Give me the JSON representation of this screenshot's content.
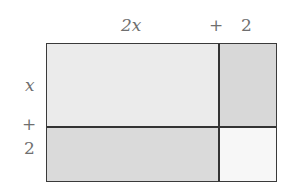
{
  "diagram": {
    "top_labels": {
      "first": "2x",
      "plus": "+",
      "second": "2"
    },
    "side_labels": {
      "first": "x",
      "plus": "+",
      "second": "2"
    },
    "regions": [
      {
        "id": "2x-by-x",
        "row": "x",
        "col": "2x",
        "color": "#ebebeb"
      },
      {
        "id": "2-by-x",
        "row": "x",
        "col": "2",
        "color": "#d8d8d8"
      },
      {
        "id": "2x-by-2",
        "row": "2",
        "col": "2x",
        "color": "#dadada"
      },
      {
        "id": "2-by-2",
        "row": "2",
        "col": "2",
        "color": "#f7f7f7"
      }
    ],
    "colors": {
      "line": "#333333",
      "label": "#6f6f6f"
    }
  }
}
